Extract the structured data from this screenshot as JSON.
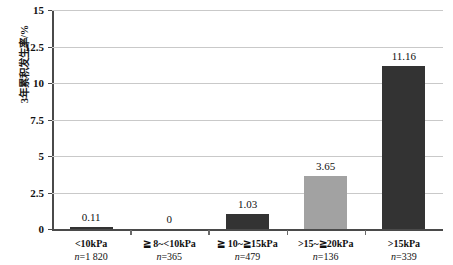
{
  "chart_data": {
    "type": "bar",
    "title": "",
    "subtitle": "",
    "xlabel": "",
    "ylabel": "3年累积发生率/%",
    "ylim": [
      0,
      15
    ],
    "yticks": [
      "0",
      "2.5",
      "5",
      "7.5",
      "10",
      "12.5",
      "15"
    ],
    "ytick_values": [
      0,
      2.5,
      5,
      7.5,
      10,
      12.5,
      15
    ],
    "grid": true,
    "legend": "none",
    "categories": [
      "<10kPa",
      "≧ 8~<10kPa",
      "≧ 10~≧15kPa",
      ">15~≧20kPa",
      ">15kPa"
    ],
    "values": [
      0.11,
      0,
      1.03,
      3.65,
      11.16
    ],
    "value_labels": [
      "0.11",
      "0",
      "1.03",
      "3.65",
      "11.16"
    ],
    "sample_sizes": [
      "n=1 820",
      "n=365",
      "n=479",
      "n=136",
      "n=339"
    ],
    "bar_colors": [
      "#333333",
      "#333333",
      "#333333",
      "#a2a2a2",
      "#333333"
    ]
  },
  "axis": {
    "y_title": "3年累积发生率/%"
  }
}
